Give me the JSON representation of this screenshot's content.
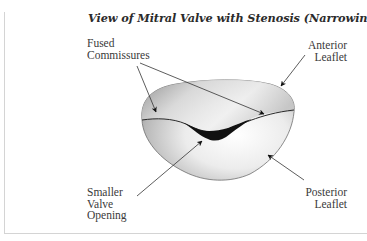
{
  "figure": {
    "title": "View of Mitral Valve with Stenosis (Narrowing)",
    "labels": {
      "fused_commissures": [
        "Fused",
        "Commissures"
      ],
      "anterior_leaflet": [
        "Anterior",
        "Leaflet"
      ],
      "smaller_valve_opening": [
        "Smaller",
        "Valve",
        "Opening"
      ],
      "posterior_leaflet": [
        "Posterior",
        "Leaflet"
      ]
    },
    "colors": {
      "text": "#3a3a3a",
      "title": "#2b2b2b",
      "valve_light": "#f4f4f4",
      "valve_dark": "#8a8a8a",
      "opening": "#111111",
      "frame": "#d4d4d4"
    }
  }
}
